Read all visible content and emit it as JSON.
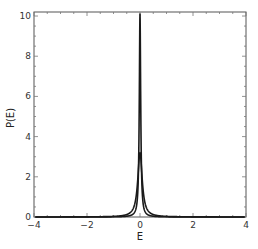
{
  "chart_data": {
    "type": "line",
    "title": "",
    "xlabel": "E",
    "ylabel": "P(E)",
    "xlim": [
      -4,
      4
    ],
    "ylim": [
      0,
      10.2
    ],
    "grid": false,
    "legend": null,
    "x_ticks": [
      -4,
      -2,
      0,
      2,
      4
    ],
    "x_tick_labels": [
      "−4",
      "−2",
      "0",
      "2",
      "4"
    ],
    "y_ticks": [
      0,
      2,
      4,
      6,
      8,
      10
    ],
    "y_tick_labels": [
      "0",
      "2",
      "4",
      "6",
      "8",
      "10"
    ],
    "series": [
      {
        "name": "narrow peak",
        "shape": "lorentzian",
        "center": 0,
        "peak": 10.1,
        "halfwidth": 0.0315,
        "color": "#1a1a1a"
      },
      {
        "name": "wide peak",
        "shape": "lorentzian",
        "center": 0,
        "peak": 3.2,
        "halfwidth": 0.1,
        "color": "#1a1a1a"
      }
    ]
  },
  "frame": {
    "left": 34,
    "right": 246,
    "top": 12,
    "bottom": 217,
    "axis_color": "#555555"
  }
}
